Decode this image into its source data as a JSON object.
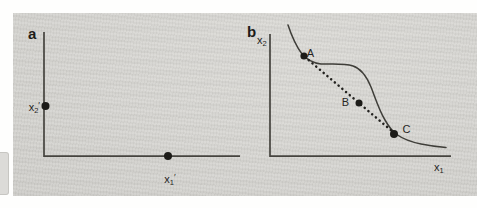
{
  "figure": {
    "panel_a": {
      "label": "a",
      "y_point_label": {
        "base": "x",
        "sub": "2",
        "prime": "′"
      },
      "x_point_label": {
        "base": "x",
        "sub": "1",
        "prime": "′"
      }
    },
    "panel_b": {
      "label": "b",
      "y_axis_label": {
        "base": "x",
        "sub": "2"
      },
      "x_axis_label": {
        "base": "x",
        "sub": "1"
      },
      "point_labels": {
        "a": "A",
        "b": "B",
        "c": "C"
      }
    },
    "colors": {
      "page_margin": "#ffffff",
      "paper_grey": "#d6d5d1",
      "ink": "#2a2925",
      "axis_line": "#46443f",
      "dot_fill": "#1c1b18"
    }
  }
}
